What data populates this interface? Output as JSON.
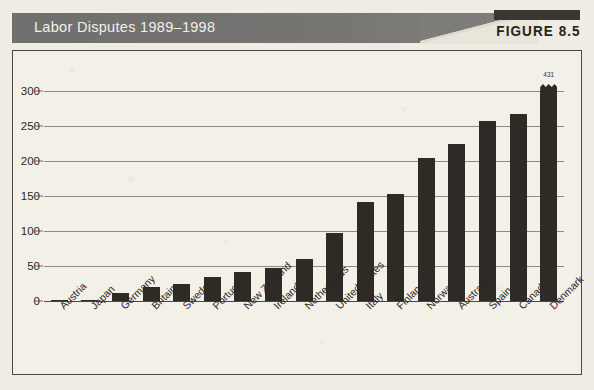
{
  "header": {
    "title": "Labor Disputes 1989–1998",
    "figure_label": "FIGURE 8.5"
  },
  "chart_data": {
    "type": "bar",
    "title": "Labor Disputes 1989–1998",
    "xlabel": "",
    "ylabel": "",
    "ylim": [
      0,
      300
    ],
    "yticks": [
      0,
      50,
      100,
      150,
      200,
      250,
      300
    ],
    "grid": true,
    "legend": null,
    "bar_color": "#2e2b27",
    "categories": [
      "Austria",
      "Japan",
      "Germany",
      "Britain",
      "Sweden",
      "Portugal",
      "New Zealand",
      "Ireland",
      "Netherlands",
      "United States",
      "Italy",
      "Finland",
      "Norway",
      "Australia",
      "Spain",
      "Canada",
      "Denmark"
    ],
    "values": [
      1,
      2,
      11,
      20,
      25,
      35,
      41,
      47,
      60,
      97,
      142,
      153,
      204,
      224,
      257,
      267,
      431
    ],
    "annotations": [
      {
        "category": "Denmark",
        "text": "431",
        "note": "bar exceeds axis maximum; drawn with broken zig-zag top"
      }
    ]
  }
}
